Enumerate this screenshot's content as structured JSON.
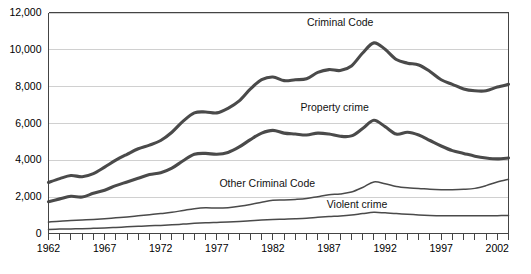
{
  "chart_data": {
    "type": "line",
    "title": "",
    "subtitle": "",
    "xlabel": "",
    "ylabel": "",
    "xlim": [
      1962,
      2003
    ],
    "ylim": [
      0,
      12000
    ],
    "grid": true,
    "legend_position": "inline-labels",
    "y_ticks": [
      "0",
      "2,000",
      "4,000",
      "6,000",
      "8,000",
      "10,000",
      "12,000"
    ],
    "y_tick_values": [
      0,
      2000,
      4000,
      6000,
      8000,
      10000,
      12000
    ],
    "x_ticks": [
      "1962",
      "1967",
      "1972",
      "1977",
      "1982",
      "1987",
      "1992",
      "1997",
      "2002"
    ],
    "x_tick_values": [
      1962,
      1967,
      1972,
      1977,
      1982,
      1987,
      1992,
      1997,
      2002
    ],
    "x_all_years": [
      1962,
      1963,
      1964,
      1965,
      1966,
      1967,
      1968,
      1969,
      1970,
      1971,
      1972,
      1973,
      1974,
      1975,
      1976,
      1977,
      1978,
      1979,
      1980,
      1981,
      1982,
      1983,
      1984,
      1985,
      1986,
      1987,
      1988,
      1989,
      1990,
      1991,
      1992,
      1993,
      1994,
      1995,
      1996,
      1997,
      1998,
      1999,
      2000,
      2001,
      2002,
      2003
    ],
    "series": [
      {
        "name": "Criminal Code",
        "label": "Criminal Code",
        "color": "#4a4a4a",
        "width": "thick",
        "label_x": 1988.0,
        "label_y": 11250,
        "values": [
          2770,
          2980,
          3150,
          3080,
          3250,
          3600,
          3980,
          4300,
          4600,
          4800,
          5050,
          5500,
          6100,
          6550,
          6600,
          6550,
          6800,
          7200,
          7850,
          8350,
          8500,
          8300,
          8350,
          8400,
          8750,
          8900,
          8850,
          9100,
          9800,
          10350,
          10000,
          9450,
          9250,
          9150,
          8800,
          8350,
          8100,
          7850,
          7750,
          7750,
          7950,
          8100
        ]
      },
      {
        "name": "Property crime",
        "label": "Property crime",
        "color": "#4a4a4a",
        "width": "thick",
        "label_x": 1987.5,
        "label_y": 6650,
        "values": [
          1730,
          1880,
          2020,
          1980,
          2180,
          2350,
          2600,
          2800,
          3000,
          3200,
          3300,
          3550,
          3950,
          4300,
          4350,
          4300,
          4400,
          4700,
          5100,
          5450,
          5600,
          5450,
          5400,
          5350,
          5450,
          5400,
          5280,
          5300,
          5700,
          6150,
          5800,
          5400,
          5500,
          5350,
          5050,
          4750,
          4500,
          4350,
          4200,
          4100,
          4050,
          4100
        ]
      },
      {
        "name": "Other Criminal Code",
        "label": "Other Criminal Code",
        "color": "#4a4a4a",
        "width": "thin",
        "label_x": 1981.5,
        "label_y": 2550,
        "values": [
          620,
          670,
          700,
          730,
          760,
          800,
          850,
          900,
          960,
          1020,
          1080,
          1150,
          1250,
          1350,
          1400,
          1380,
          1400,
          1480,
          1580,
          1700,
          1800,
          1820,
          1850,
          1900,
          2000,
          2100,
          2150,
          2250,
          2500,
          2800,
          2700,
          2550,
          2480,
          2450,
          2400,
          2380,
          2380,
          2400,
          2450,
          2600,
          2800,
          2950
        ]
      },
      {
        "name": "Violent crime",
        "label": "Violent crime",
        "color": "#4a4a4a",
        "width": "thin",
        "label_x": 1989.5,
        "label_y": 1400,
        "values": [
          220,
          240,
          250,
          260,
          280,
          300,
          330,
          360,
          390,
          420,
          440,
          470,
          510,
          550,
          580,
          600,
          620,
          650,
          690,
          730,
          760,
          780,
          800,
          830,
          880,
          920,
          950,
          1000,
          1080,
          1150,
          1120,
          1080,
          1050,
          1010,
          980,
          960,
          960,
          960,
          960,
          960,
          970,
          980
        ]
      }
    ]
  }
}
